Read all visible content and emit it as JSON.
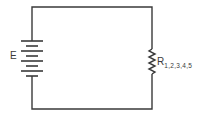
{
  "diagram": {
    "type": "circuit-schematic",
    "components": [
      {
        "id": "source",
        "kind": "battery",
        "label": "E",
        "cells": 4
      },
      {
        "id": "load",
        "kind": "resistor",
        "label": "R",
        "subscript": "1,2,3,4,5"
      }
    ],
    "connections": [
      [
        "source.top",
        "load.top"
      ],
      [
        "source.bottom",
        "load.bottom"
      ]
    ],
    "colors": {
      "line": "#3a3a3a",
      "background": "#ffffff"
    }
  }
}
